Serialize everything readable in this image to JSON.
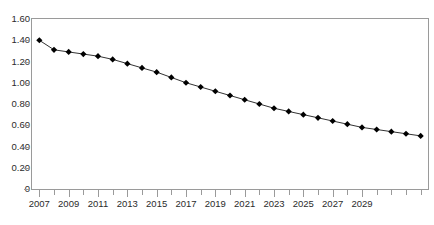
{
  "chart_data": {
    "type": "line",
    "title": "",
    "subtitle": "",
    "xlabel": "",
    "ylabel": "",
    "xlim": [
      2006.5,
      2033.5
    ],
    "ylim": [
      0,
      1.6
    ],
    "ytick_labels": [
      "1.60",
      "1.40",
      "1.20",
      "1.00",
      "0.80",
      "0.60",
      "0.40",
      "0.20",
      "0"
    ],
    "ytick_values": [
      1.6,
      1.4,
      1.2,
      1.0,
      0.8,
      0.6,
      0.4,
      0.2,
      0
    ],
    "xtick_labels": [
      "2007",
      "2009",
      "2011",
      "2013",
      "2015",
      "2017",
      "2019",
      "2021",
      "2023",
      "2025",
      "2027",
      "2029"
    ],
    "xtick_values": [
      2007,
      2009,
      2011,
      2013,
      2015,
      2017,
      2019,
      2021,
      2023,
      2025,
      2027,
      2029
    ],
    "grid": false,
    "legend": null,
    "legend_position": "none",
    "annotations": [],
    "marker": "diamond",
    "marker_color": "#000000",
    "line_color": "#333333",
    "x": [
      2007,
      2008,
      2009,
      2010,
      2011,
      2012,
      2013,
      2014,
      2015,
      2016,
      2017,
      2018,
      2019,
      2020,
      2021,
      2022,
      2023,
      2024,
      2025,
      2026,
      2027,
      2028,
      2029,
      2030,
      2031,
      2032,
      2033
    ],
    "values": [
      1.4,
      1.31,
      1.29,
      1.27,
      1.25,
      1.22,
      1.18,
      1.14,
      1.1,
      1.05,
      1.0,
      0.96,
      0.92,
      0.88,
      0.84,
      0.8,
      0.76,
      0.73,
      0.7,
      0.67,
      0.64,
      0.61,
      0.58,
      0.56,
      0.54,
      0.52,
      0.5
    ],
    "series": [
      {
        "name": "series-1",
        "values": [
          1.4,
          1.31,
          1.29,
          1.27,
          1.25,
          1.22,
          1.18,
          1.14,
          1.1,
          1.05,
          1.0,
          0.96,
          0.92,
          0.88,
          0.84,
          0.8,
          0.76,
          0.73,
          0.7,
          0.67,
          0.64,
          0.61,
          0.58,
          0.56,
          0.54,
          0.52,
          0.5
        ]
      }
    ]
  }
}
